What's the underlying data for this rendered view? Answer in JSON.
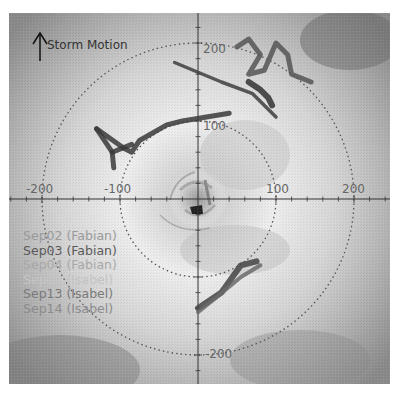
{
  "chart_data": {
    "type": "scatter",
    "title": "",
    "annotation": "Storm Motion",
    "xlabel": "",
    "ylabel": "",
    "units": "km (storm-relative)",
    "xlim": [
      -200,
      200
    ],
    "ylim": [
      -200,
      200
    ],
    "x_tick_labels": [
      "-200",
      "-100",
      "100",
      "200"
    ],
    "y_tick_labels": [
      "200",
      "100",
      "-200"
    ],
    "range_rings_km": [
      100,
      200
    ],
    "grid": false,
    "legend_position": "lower-left",
    "legend": [
      {
        "label": "Sep02 (Fabian)",
        "color": "#9a9a9a"
      },
      {
        "label": "Sep03 (Fabian)",
        "color": "#5a5a5a"
      },
      {
        "label": "Sep04 (Fabian)",
        "color": "#a8a8a8"
      },
      {
        "label": "Sep12 (Isabel)",
        "color": "#c4c4c4"
      },
      {
        "label": "Sep13 (Isabel)",
        "color": "#7a7a7a"
      },
      {
        "label": "Sep14 (Isabel)",
        "color": "#8c8c8c"
      }
    ],
    "series": [
      {
        "name": "Sep03 (Fabian) NW track",
        "points": [
          [
            -130,
            90
          ],
          [
            -95,
            65
          ],
          [
            -85,
            60
          ],
          [
            -75,
            75
          ],
          [
            -40,
            95
          ],
          [
            -20,
            100
          ],
          [
            40,
            110
          ]
        ]
      },
      {
        "name": "Sep03 (Fabian) NW branch",
        "points": [
          [
            -130,
            90
          ],
          [
            -110,
            60
          ],
          [
            -85,
            70
          ]
        ]
      },
      {
        "name": "Sep03 (Fabian) NW branch 2",
        "points": [
          [
            -110,
            60
          ],
          [
            -108,
            40
          ]
        ]
      },
      {
        "name": "Sep13 (Isabel) NE track",
        "points": [
          [
            -30,
            175
          ],
          [
            30,
            150
          ],
          [
            70,
            135
          ],
          [
            100,
            105
          ]
        ]
      },
      {
        "name": "Sep02 (Fabian) NE zigzag",
        "points": [
          [
            50,
            195
          ],
          [
            65,
            205
          ],
          [
            80,
            185
          ],
          [
            65,
            160
          ],
          [
            85,
            165
          ],
          [
            100,
            200
          ],
          [
            115,
            185
          ],
          [
            120,
            160
          ],
          [
            145,
            150
          ]
        ]
      },
      {
        "name": "Sep14 (Isabel) NE",
        "points": [
          [
            65,
            150
          ],
          [
            80,
            140
          ],
          [
            90,
            130
          ],
          [
            95,
            120
          ]
        ]
      },
      {
        "name": "Sep12 (Isabel) SE track",
        "points": [
          [
            0,
            -140
          ],
          [
            30,
            -120
          ],
          [
            55,
            -85
          ],
          [
            75,
            -80
          ]
        ]
      },
      {
        "name": "Sep04 (Fabian) SE track",
        "points": [
          [
            0,
            -145
          ],
          [
            25,
            -125
          ],
          [
            55,
            -100
          ],
          [
            80,
            -85
          ]
        ]
      }
    ]
  }
}
